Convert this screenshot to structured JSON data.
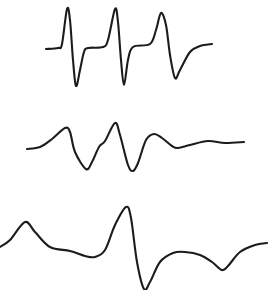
{
  "figure": {
    "background": "#ffffff",
    "line_color": "#1c1c1c"
  },
  "chart_data": {
    "type": "line",
    "title": "",
    "xlabel": "",
    "ylabel": "",
    "grid": false,
    "axes_visible": false,
    "legend": null,
    "note": "Three stacked derivative-shaped waveforms (no axes, ticks or labels). Values are pixel coordinates (x right, y down) traced from the image.",
    "series": [
      {
        "name": "top-trace",
        "points": [
          [
            46,
            49
          ],
          [
            58,
            48
          ],
          [
            62,
            44
          ],
          [
            67,
            9
          ],
          [
            70,
            20
          ],
          [
            73,
            60
          ],
          [
            76,
            86
          ],
          [
            80,
            70
          ],
          [
            84,
            52
          ],
          [
            88,
            48
          ],
          [
            103,
            47
          ],
          [
            108,
            40
          ],
          [
            115,
            9
          ],
          [
            118,
            22
          ],
          [
            121,
            60
          ],
          [
            124,
            85
          ],
          [
            128,
            60
          ],
          [
            133,
            47
          ],
          [
            150,
            44
          ],
          [
            156,
            30
          ],
          [
            161,
            13
          ],
          [
            166,
            25
          ],
          [
            170,
            55
          ],
          [
            175,
            78
          ],
          [
            180,
            70
          ],
          [
            190,
            52
          ],
          [
            200,
            46
          ],
          [
            212,
            44
          ]
        ]
      },
      {
        "name": "middle-trace",
        "points": [
          [
            27,
            149
          ],
          [
            40,
            147
          ],
          [
            52,
            139
          ],
          [
            65,
            128
          ],
          [
            70,
            132
          ],
          [
            75,
            152
          ],
          [
            86,
            169
          ],
          [
            92,
            162
          ],
          [
            99,
            147
          ],
          [
            105,
            141
          ],
          [
            115,
            123
          ],
          [
            120,
            135
          ],
          [
            128,
            165
          ],
          [
            133,
            171
          ],
          [
            138,
            163
          ],
          [
            146,
            140
          ],
          [
            154,
            134
          ],
          [
            162,
            138
          ],
          [
            172,
            146
          ],
          [
            178,
            148
          ],
          [
            190,
            145
          ],
          [
            208,
            141
          ],
          [
            225,
            143
          ],
          [
            244,
            142
          ]
        ]
      },
      {
        "name": "bottom-trace",
        "points": [
          [
            0,
            247
          ],
          [
            10,
            240
          ],
          [
            25,
            222
          ],
          [
            35,
            232
          ],
          [
            50,
            247
          ],
          [
            70,
            251
          ],
          [
            85,
            256
          ],
          [
            95,
            257
          ],
          [
            105,
            250
          ],
          [
            115,
            225
          ],
          [
            126,
            207
          ],
          [
            131,
            218
          ],
          [
            137,
            262
          ],
          [
            144,
            289
          ],
          [
            150,
            282
          ],
          [
            160,
            262
          ],
          [
            173,
            253
          ],
          [
            185,
            252
          ],
          [
            200,
            255
          ],
          [
            212,
            262
          ],
          [
            222,
            270
          ],
          [
            228,
            266
          ],
          [
            240,
            252
          ],
          [
            255,
            245
          ],
          [
            267,
            243
          ]
        ]
      }
    ]
  }
}
